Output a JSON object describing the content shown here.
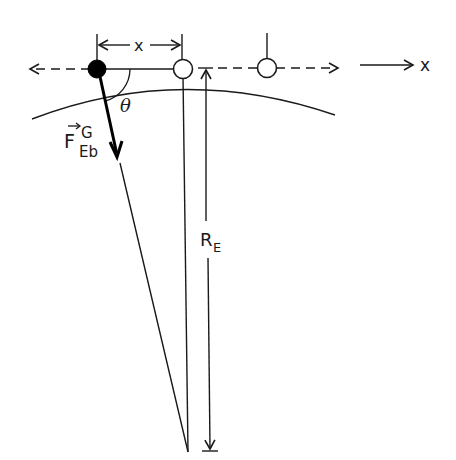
{
  "diagram": {
    "labels": {
      "x_distance": "x",
      "angle": "θ",
      "force_main": "F",
      "force_sup": "G",
      "force_sub": "Eb",
      "earth_radius_main": "R",
      "earth_radius_sub": "E",
      "axis": "x"
    },
    "colors": {
      "stroke": "#1a1a1a",
      "ball_filled": "#000000",
      "ball_hollow": "#ffffff",
      "background": "#ffffff"
    },
    "elements": {
      "filled_ball": {
        "cx": 97,
        "cy": 69
      },
      "hollow_ball_center": {
        "cx": 183,
        "cy": 69
      },
      "hollow_ball_right": {
        "cx": 267,
        "cy": 68
      },
      "earth_center": {
        "x": 188,
        "y": 452
      }
    }
  }
}
